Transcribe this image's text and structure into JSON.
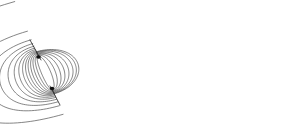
{
  "figure": {
    "background_color": "#ffffff",
    "line_color": "#3a3a3a",
    "outer_line_color": "#555555",
    "inner_line_color": "#2b2b2b",
    "axis_color": "#222222",
    "canvas": {
      "width": 296,
      "height": 126
    }
  },
  "chart_data": {
    "type": "line",
    "subtitle": "",
    "xlabel": "",
    "ylabel": "",
    "xlim": [
      0,
      296
    ],
    "ylim": [
      0,
      126
    ],
    "grid": false,
    "legend": null,
    "annotations": [],
    "poles": [
      {
        "name": "north-pole",
        "x": 38.5,
        "y": 57.0
      },
      {
        "name": "south-pole",
        "x": 52.0,
        "y": 88.5
      }
    ],
    "dipole_axis": {
      "tilt_degrees": 23,
      "stub_top": {
        "x1": 30.0,
        "y1": 40.0,
        "x2": 41.0,
        "y2": 60.0
      },
      "stub_bottom": {
        "x1": 50.0,
        "y1": 86.0,
        "x2": 60.0,
        "y2": 105.0
      }
    },
    "series": [
      {
        "name": "right-lobe-loop-01",
        "side": "right",
        "reach": 4.5,
        "values": []
      },
      {
        "name": "right-lobe-loop-02",
        "side": "right",
        "reach": 8.0,
        "values": []
      },
      {
        "name": "right-lobe-loop-03",
        "side": "right",
        "reach": 11.5,
        "values": []
      },
      {
        "name": "right-lobe-loop-04",
        "side": "right",
        "reach": 15.0,
        "values": []
      },
      {
        "name": "right-lobe-loop-05",
        "side": "right",
        "reach": 18.5,
        "values": []
      },
      {
        "name": "right-lobe-loop-06",
        "side": "right",
        "reach": 22.0,
        "values": []
      },
      {
        "name": "right-lobe-loop-07",
        "side": "right",
        "reach": 26.0,
        "values": []
      },
      {
        "name": "right-lobe-loop-08",
        "side": "right",
        "reach": 31.0,
        "values": []
      },
      {
        "name": "right-lobe-loop-09",
        "side": "right",
        "reach": 37.0,
        "values": []
      },
      {
        "name": "right-lobe-loop-10",
        "side": "right",
        "reach": 45.0,
        "values": []
      },
      {
        "name": "right-lobe-loop-11",
        "side": "right",
        "reach": 56.0,
        "values": []
      },
      {
        "name": "right-lobe-loop-12",
        "side": "right",
        "reach": 72.0,
        "values": []
      },
      {
        "name": "right-lobe-loop-13",
        "side": "right",
        "reach": 108.0,
        "values": []
      },
      {
        "name": "right-lobe-loop-14",
        "side": "right",
        "reach": 232.0,
        "values": []
      },
      {
        "name": "left-lobe-loop-01",
        "side": "left",
        "reach": 6.0,
        "values": []
      },
      {
        "name": "left-lobe-loop-02",
        "side": "left",
        "reach": 11.0,
        "values": []
      },
      {
        "name": "left-lobe-loop-03",
        "side": "left",
        "reach": 16.0,
        "values": []
      },
      {
        "name": "left-lobe-loop-04",
        "side": "left",
        "reach": 21.0,
        "values": []
      },
      {
        "name": "left-lobe-loop-05",
        "side": "left",
        "reach": 26.0,
        "values": []
      },
      {
        "name": "left-lobe-loop-06",
        "side": "left",
        "reach": 31.0,
        "values": []
      },
      {
        "name": "left-lobe-loop-07",
        "side": "left",
        "reach": 35.0,
        "values": []
      },
      {
        "name": "left-lobe-loop-08",
        "side": "left",
        "reach": 38.0,
        "values": []
      }
    ],
    "right_lobe_count": 14,
    "left_lobe_count": 8,
    "outermost_loop_extent": {
      "left": 40,
      "right": 286,
      "top": 10,
      "bottom": 119
    }
  }
}
